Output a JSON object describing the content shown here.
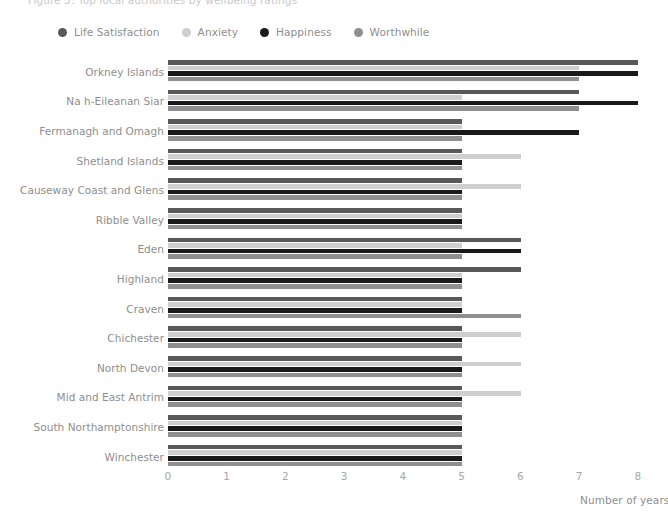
{
  "title_cutoff": "Figure 3: Top local authorities by wellbeing ratings",
  "legend": {
    "items": [
      {
        "label": "Life Satisfaction",
        "color": "#595959"
      },
      {
        "label": "Anxiety",
        "color": "#cfcfcf"
      },
      {
        "label": "Happiness",
        "color": "#1a1a1a"
      },
      {
        "label": "Worthwhile",
        "color": "#8f8f8f"
      }
    ]
  },
  "chart_data": {
    "type": "bar",
    "orientation": "horizontal",
    "title": "",
    "xlabel": "Number of years",
    "ylabel": "",
    "xlim": [
      0,
      8
    ],
    "xticks": [
      "0",
      "1",
      "2",
      "3",
      "4",
      "5",
      "6",
      "7",
      "8"
    ],
    "grid": false,
    "legend_position": "top-left",
    "categories": [
      "Orkney Islands",
      "Na h-Eileanan Siar",
      "Fermanagh and Omagh",
      "Shetland Islands",
      "Causeway Coast and Glens",
      "Ribble Valley",
      "Eden",
      "Highland",
      "Craven",
      "Chichester",
      "North Devon",
      "Mid and East Antrim",
      "South Northamptonshire",
      "Winchester"
    ],
    "series": [
      {
        "name": "Life Satisfaction",
        "color": "#595959",
        "values": [
          8,
          7,
          5,
          5,
          5,
          5,
          6,
          6,
          5,
          5,
          5,
          5,
          5,
          5
        ]
      },
      {
        "name": "Anxiety",
        "color": "#cfcfcf",
        "values": [
          7,
          5,
          5,
          6,
          6,
          5,
          5,
          5,
          5,
          6,
          6,
          6,
          5,
          5
        ]
      },
      {
        "name": "Happiness",
        "color": "#1a1a1a",
        "values": [
          8,
          8,
          7,
          5,
          5,
          5,
          6,
          5,
          5,
          5,
          5,
          5,
          5,
          5
        ]
      },
      {
        "name": "Worthwhile",
        "color": "#8f8f8f",
        "values": [
          7,
          7,
          5,
          5,
          5,
          5,
          5,
          5,
          6,
          5,
          5,
          5,
          5,
          5
        ]
      }
    ]
  }
}
